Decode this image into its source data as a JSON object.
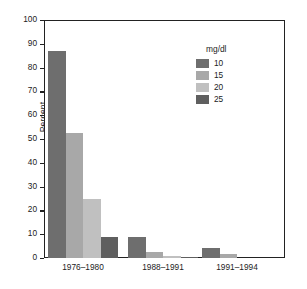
{
  "chart_data": {
    "type": "bar",
    "title": "",
    "subtitle": "",
    "xlabel": "",
    "ylabel": "Percent",
    "categories": [
      "1976–1980",
      "1988–1991",
      "1991–1994"
    ],
    "series": [
      {
        "name": "10",
        "color": "#6e6e6e",
        "values": [
          87,
          9,
          4
        ]
      },
      {
        "name": "15",
        "color": "#a8a8a8",
        "values": [
          52.5,
          2.5,
          1.5
        ]
      },
      {
        "name": "20",
        "color": "#c0c0c0",
        "values": [
          24.8,
          1.0,
          0
        ]
      },
      {
        "name": "25",
        "color": "#5f5f5f",
        "values": [
          9,
          0.3,
          0
        ]
      }
    ],
    "ylim": [
      0,
      100
    ],
    "yticks": [
      0,
      10,
      20,
      30,
      40,
      50,
      60,
      70,
      80,
      90,
      100
    ],
    "ytick_labels": [
      "0",
      "10",
      "20",
      "30",
      "40",
      "50",
      "60",
      "70",
      "80",
      "90",
      "100"
    ],
    "grid": false,
    "legend": {
      "title": "mg/dl",
      "position": "top-right",
      "entries": [
        {
          "label": "10",
          "color": "#6e6e6e"
        },
        {
          "label": "15",
          "color": "#a8a8a8"
        },
        {
          "label": "20",
          "color": "#c0c0c0"
        },
        {
          "label": "25",
          "color": "#5f5f5f"
        }
      ]
    }
  }
}
